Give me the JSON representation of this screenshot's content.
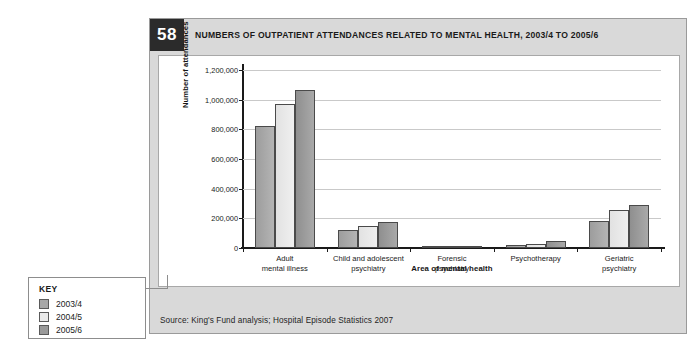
{
  "figure": {
    "number": "58",
    "title": "NUMBERS OF OUTPATIENT ATTENDANCES RELATED TO MENTAL HEALTH, 2003/4 TO 2005/6",
    "source": "Source: King's Fund analysis; Hospital Episode Statistics 2007"
  },
  "key": {
    "heading": "KEY",
    "items": [
      {
        "label": "2003/4",
        "color": "#a8a8a8"
      },
      {
        "label": "2004/5",
        "color": "#eaeaea"
      },
      {
        "label": "2005/6",
        "color": "#9a9a9a"
      }
    ]
  },
  "chart_data": {
    "type": "bar",
    "title": "NUMBERS OF OUTPATIENT ATTENDANCES RELATED TO MENTAL HEALTH, 2003/4 TO 2005/6",
    "xlabel": "Area of mental health",
    "ylabel": "Number of attendances",
    "ylim": [
      0,
      1200000
    ],
    "ytick_values": [
      0,
      200000,
      400000,
      600000,
      800000,
      1000000,
      1200000
    ],
    "ytick_labels": [
      "0",
      "200,000",
      "400,000",
      "600,000",
      "800,000",
      "1,000,000",
      "1,200,000"
    ],
    "grid": true,
    "legend_position": "external-left",
    "categories": [
      "Adult\nmental illness",
      "Child and adolescent\npsychiatry",
      "Forensic\npsychiatry",
      "Psychotherapy",
      "Geriatric\npsychiatry"
    ],
    "category_labels": [
      [
        "Adult",
        "mental illness"
      ],
      [
        "Child and adolescent",
        "psychiatry"
      ],
      [
        "Forensic",
        "psychiatry"
      ],
      [
        "Psychotherapy",
        ""
      ],
      [
        "Geriatric",
        "psychiatry"
      ]
    ],
    "series": [
      {
        "name": "2003/4",
        "color": "#a8a8a8",
        "values": [
          820000,
          122000,
          12000,
          22000,
          180000
        ]
      },
      {
        "name": "2004/5",
        "color": "#eaeaea",
        "values": [
          972000,
          150000,
          13000,
          25000,
          255000
        ]
      },
      {
        "name": "2005/6",
        "color": "#9a9a9a",
        "values": [
          1062000,
          176000,
          14000,
          45000,
          290000
        ]
      }
    ]
  }
}
